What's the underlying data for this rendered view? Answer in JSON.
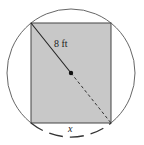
{
  "diagram": {
    "diagonal_label": "8 ft",
    "arc_label": "x",
    "colors": {
      "rectangle_fill": "#c8c8c8",
      "stroke": "#444444",
      "background": "#ffffff"
    },
    "circle": {
      "cx": 71,
      "cy": 73,
      "r": 64
    },
    "rectangle": {
      "x": 31,
      "y": 23,
      "width": 80,
      "height": 100
    },
    "center_point": {
      "x": 71,
      "y": 73
    }
  }
}
